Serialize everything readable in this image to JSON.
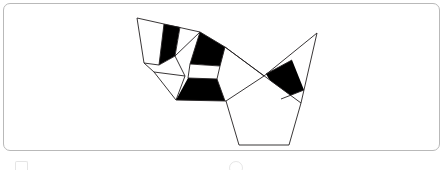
{
  "figure": {
    "title": "",
    "caption": "",
    "panel": {
      "background_color": "#ffffff",
      "border_color": "#b9b9b9",
      "corner_radius_px": 7,
      "width_px": 437,
      "height_px": 148
    }
  },
  "diagram": {
    "kind": "polyhedron-net",
    "stroke_color": "#231f20",
    "stroke_width_px": 0.9,
    "fill_colors": {
      "white": "#ffffff",
      "black": "#000000"
    },
    "vertices": {
      "top_left_apex": [
        136,
        17
      ],
      "left_outer": [
        143,
        62
      ],
      "left_lower": [
        150,
        68
      ],
      "lower_left_foot": [
        172,
        96
      ],
      "center_hub": [
        196,
        33
      ],
      "mid_left": [
        171,
        52
      ],
      "mid_lower_left": [
        181,
        72
      ],
      "mid_lower_right": [
        213,
        71
      ],
      "mid_upper_right": [
        216,
        45
      ],
      "band_right": [
        222,
        97
      ],
      "crossing_point": [
        260,
        72
      ],
      "top_right_apex": [
        313,
        29
      ],
      "right_outer_lower": [
        297,
        99
      ],
      "bottom_left": [
        235,
        141
      ],
      "bottom_right": [
        285,
        141
      ]
    },
    "faces": [
      {
        "id": "face-top-left-white",
        "shade": "white"
      },
      {
        "id": "face-top-left-black-stripe",
        "shade": "black"
      },
      {
        "id": "face-upper-middle-white",
        "shade": "white"
      },
      {
        "id": "face-upper-right-black",
        "shade": "black"
      },
      {
        "id": "face-left-wedge-white",
        "shade": "white"
      },
      {
        "id": "face-center-white-band",
        "shade": "white"
      },
      {
        "id": "face-lower-black-band",
        "shade": "black"
      },
      {
        "id": "face-right-triangle-white",
        "shade": "white"
      },
      {
        "id": "face-right-black-band",
        "shade": "black"
      },
      {
        "id": "face-bottom-pentagon-white",
        "shade": "white"
      }
    ],
    "face_count": 10,
    "black_face_count": 4,
    "white_face_count": 6
  },
  "artifacts": {
    "left_glyph": "partial-icon-top-edge",
    "center_glyph": "partial-circle-glyph"
  }
}
